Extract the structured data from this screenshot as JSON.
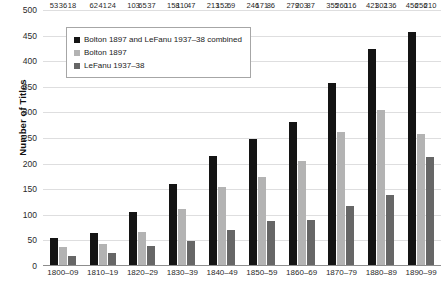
{
  "chart_data": {
    "type": "bar",
    "title": "",
    "xlabel": "",
    "ylabel": "Number of Titles",
    "ylim": [
      0,
      500
    ],
    "ytick_step": 50,
    "yticks": [
      500,
      450,
      400,
      350,
      300,
      250,
      200,
      150,
      100,
      50,
      0
    ],
    "grid": true,
    "legend_position": "top-left",
    "categories": [
      "1800–09",
      "1810–19",
      "1820–29",
      "1830–39",
      "1840–49",
      "1850–59",
      "1860–69",
      "1870–79",
      "1880–89",
      "1890–99"
    ],
    "series": [
      {
        "name": "Bolton 1897 and LeFanu 1937–38 combined",
        "color": "#141414",
        "values": [
          53,
          62,
          103,
          158,
          213,
          246,
          279,
          355,
          421,
          456
        ]
      },
      {
        "name": "Bolton 1897",
        "color": "#b3b3b3",
        "values": [
          36,
          41,
          65,
          110,
          152,
          171,
          203,
          260,
          302,
          256
        ]
      },
      {
        "name": "LeFanu 1937–38",
        "color": "#666666",
        "values": [
          18,
          24,
          37,
          47,
          69,
          86,
          87,
          116,
          136,
          210
        ]
      }
    ]
  },
  "legend": {
    "items": [
      {
        "label": "Bolton 1897 and LeFanu 1937–38 combined",
        "color": "#141414"
      },
      {
        "label": "Bolton 1897",
        "color": "#b3b3b3"
      },
      {
        "label": "LeFanu 1937–38",
        "color": "#666666"
      }
    ]
  },
  "colors": {
    "gridline": "#dededf",
    "axis": "#8d8d8d",
    "text": "#2a2a2a",
    "background": "#ffffff"
  }
}
